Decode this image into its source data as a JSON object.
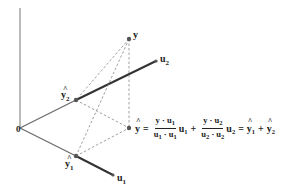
{
  "diagram": {
    "labels": {
      "origin": "0",
      "y": "y",
      "u1": "u",
      "u1_sub": "1",
      "u2": "u",
      "u2_sub": "2",
      "yhat1": "y",
      "yhat1_sub": "1",
      "yhat2": "y",
      "yhat2_sub": "2"
    },
    "points": {
      "origin": [
        20,
        128
      ],
      "axis_top": [
        20,
        8
      ],
      "y": [
        129,
        39
      ],
      "u2": [
        156,
        61
      ],
      "yhat2": [
        76,
        100
      ],
      "yhat": [
        129,
        128
      ],
      "yhat1": [
        76,
        156
      ],
      "u1": [
        113,
        175
      ]
    },
    "formula": {
      "lhs": "y",
      "eq": "=",
      "frac1_num": "y · u",
      "frac1_num_sub": "1",
      "frac1_den_a": "u",
      "frac1_den_a_sub": "1",
      "frac1_den_dot": " · ",
      "frac1_den_b": "u",
      "frac1_den_b_sub": "1",
      "vec1": "u",
      "vec1_sub": "1",
      "plus": "+",
      "frac2_num": "y · u",
      "frac2_num_sub": "2",
      "frac2_den_a": "u",
      "frac2_den_a_sub": "2",
      "frac2_den_dot": " · ",
      "frac2_den_b": "u",
      "frac2_den_b_sub": "2",
      "vec2": "u",
      "vec2_sub": "2",
      "eq2": "=",
      "r1": "y",
      "r1_sub": "1",
      "plus2": "+",
      "r2": "y",
      "r2_sub": "2"
    }
  }
}
